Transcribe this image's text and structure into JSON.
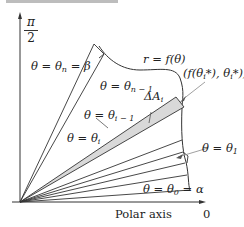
{
  "figure": {
    "top_strip": "",
    "vertical_axis_label": {
      "numerator": "π",
      "denominator": "2"
    },
    "horizontal_axis_label": "Polar axis",
    "origin_label": "0",
    "curve_label": "r = f(θ)",
    "labels": {
      "theta_n": "θ = θn = β",
      "theta_n_minus_1": "θ = θn − 1",
      "theta_i_minus_1": "θ = θi − 1",
      "theta_i": "θ = θi",
      "theta_1": "θ = θ1",
      "theta_0": "θ = θ0 = α",
      "delta_area": "ΔAi",
      "sample_point": "(f(θi*), θi*)"
    },
    "parts": {
      "theta": "θ",
      "eq": " = ",
      "n": "n",
      "n_minus_1": "n − 1",
      "i": "i",
      "i_minus_1": "i − 1",
      "one": "1",
      "zero": "0",
      "beta": "β",
      "alpha": "α",
      "delta_A": "ΔA",
      "f_open": "(f(θ",
      "star_close": "*), θ",
      "star_end": "*))",
      "r_eq_f": "r = f(θ)"
    },
    "colors": {
      "line": "#333333",
      "shaded_wedge": "#d9d9d9",
      "pointer": "#888888"
    }
  }
}
